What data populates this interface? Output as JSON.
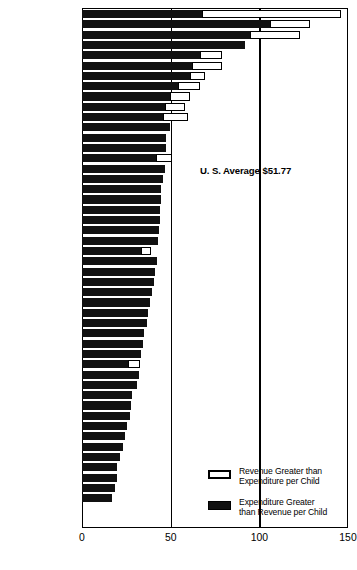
{
  "chart_data": {
    "type": "bar",
    "orientation": "horizontal",
    "title": "",
    "subtitle": "",
    "xlabel": "",
    "ylabel": "",
    "xlim": [
      0,
      150
    ],
    "xticks": [
      0,
      50,
      100,
      150
    ],
    "xticklabels": [
      "0",
      "50",
      "100",
      "150"
    ],
    "grid": true,
    "gridlines_at": [
      50,
      100
    ],
    "legend_position": "inside-lower-right",
    "annotation": {
      "text": "U. S. Average $51.77",
      "value": 51.77
    },
    "legend": [
      {
        "key": "revenue_greater",
        "style": "white",
        "label_line1": "Revenue Greater than",
        "label_line2": "Expenditure per Child"
      },
      {
        "key": "expenditure_greater",
        "style": "black",
        "label_line1": "Expenditure Greater",
        "label_line2": "than Revenue per Child"
      }
    ],
    "categories": [
      "Delaware",
      "Nevada",
      "New York",
      "California",
      "New Jersey",
      "Massachusetts",
      "Connecticut",
      "Oregon",
      "Rhode Island",
      "Wyoming",
      "Maryland",
      "Montana",
      "Ohio",
      "Illinois",
      "Missouri",
      "Nebraska",
      "Pennsylvania",
      "New Hampshire",
      "Iowa",
      "Kansas",
      "Minnesota",
      "Washington",
      "Michigan",
      "Florida",
      "Colorado",
      "Idaho",
      "Wisconsin",
      "Indiana",
      "Maine",
      "Vermont",
      "Utah",
      "Texas",
      "West Virginia",
      "South Dakota",
      "Virginia",
      "North Dakota",
      "Arizona",
      "Oklahoma",
      "Tennessee",
      "New Mexico",
      "North Carolina",
      "Kentucky",
      "Louisiana",
      "Georgia",
      "Arkansas",
      "Alabama",
      "South Carolina",
      "Mississippi"
    ],
    "series": [
      {
        "name": "Expenditure Greater than Revenue per Child",
        "style": "black",
        "values": [
          67.8,
          106.0,
          94.8,
          92.0,
          66.5,
          62.0,
          60.9,
          54.2,
          49.6,
          46.8,
          45.9,
          49.4,
          47.5,
          47.2,
          41.9,
          46.8,
          45.9,
          44.6,
          44.6,
          44.1,
          43.8,
          43.5,
          43.0,
          33.3,
          42.2,
          41.1,
          40.5,
          39.4,
          38.5,
          37.2,
          36.4,
          35.0,
          34.4,
          33.3,
          26.0,
          32.2,
          31.1,
          28.0,
          27.4,
          26.8,
          25.4,
          24.5,
          23.1,
          21.7,
          20.0,
          19.5,
          18.6,
          16.9
        ]
      },
      {
        "name": "Revenue Greater than Expenditure per Child",
        "style": "white",
        "values": [
          146.0,
          128.6,
          122.9,
          91.8,
          78.9,
          78.9,
          69.4,
          66.5,
          60.9,
          58.0,
          59.7,
          49.4,
          47.5,
          47.2,
          50.5,
          46.8,
          45.9,
          44.6,
          44.6,
          44.1,
          43.8,
          43.5,
          43.0,
          39.0,
          42.2,
          41.1,
          40.5,
          39.4,
          38.5,
          37.2,
          36.4,
          35.0,
          34.4,
          33.3,
          32.8,
          32.2,
          31.1,
          28.0,
          27.4,
          26.8,
          25.4,
          24.5,
          23.1,
          21.7,
          20.0,
          19.5,
          18.6,
          16.9
        ]
      }
    ]
  }
}
